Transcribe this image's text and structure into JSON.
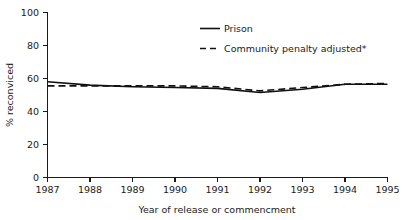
{
  "chart_data": {
    "type": "line",
    "title": "",
    "xlabel": "Year of release or commencment",
    "ylabel": "% reconviced",
    "x": [
      1987,
      1988,
      1989,
      1990,
      1991,
      1992,
      1993,
      1994,
      1995
    ],
    "xticklabels": [
      "1987",
      "1988",
      "1989",
      "1990",
      "1991",
      "1992",
      "1993",
      "1994",
      "1995"
    ],
    "yticklabels": [
      "0",
      "20",
      "40",
      "60",
      "80",
      "100"
    ],
    "yticks": [
      0,
      20,
      40,
      60,
      80,
      100
    ],
    "xlim": [
      1987,
      1995
    ],
    "ylim": [
      0,
      100
    ],
    "grid": false,
    "legend_position": "upper right inside",
    "series": [
      {
        "name": "Prison",
        "style": "solid",
        "color": "#111111",
        "values": [
          58,
          56,
          55,
          54.5,
          54,
          51.5,
          53.5,
          56.5,
          56.5
        ]
      },
      {
        "name": "Community penalty adjusted*",
        "style": "dashed",
        "color": "#111111",
        "values": [
          55.5,
          55.5,
          55.5,
          55.5,
          55,
          52.5,
          54.5,
          56.5,
          57
        ]
      }
    ]
  },
  "axis": {
    "y_title": "% reconviced",
    "x_title": "Year of release or commencment"
  },
  "legend": {
    "entries": [
      {
        "label": "Prison"
      },
      {
        "label": "Community penalty adjusted*"
      }
    ]
  }
}
